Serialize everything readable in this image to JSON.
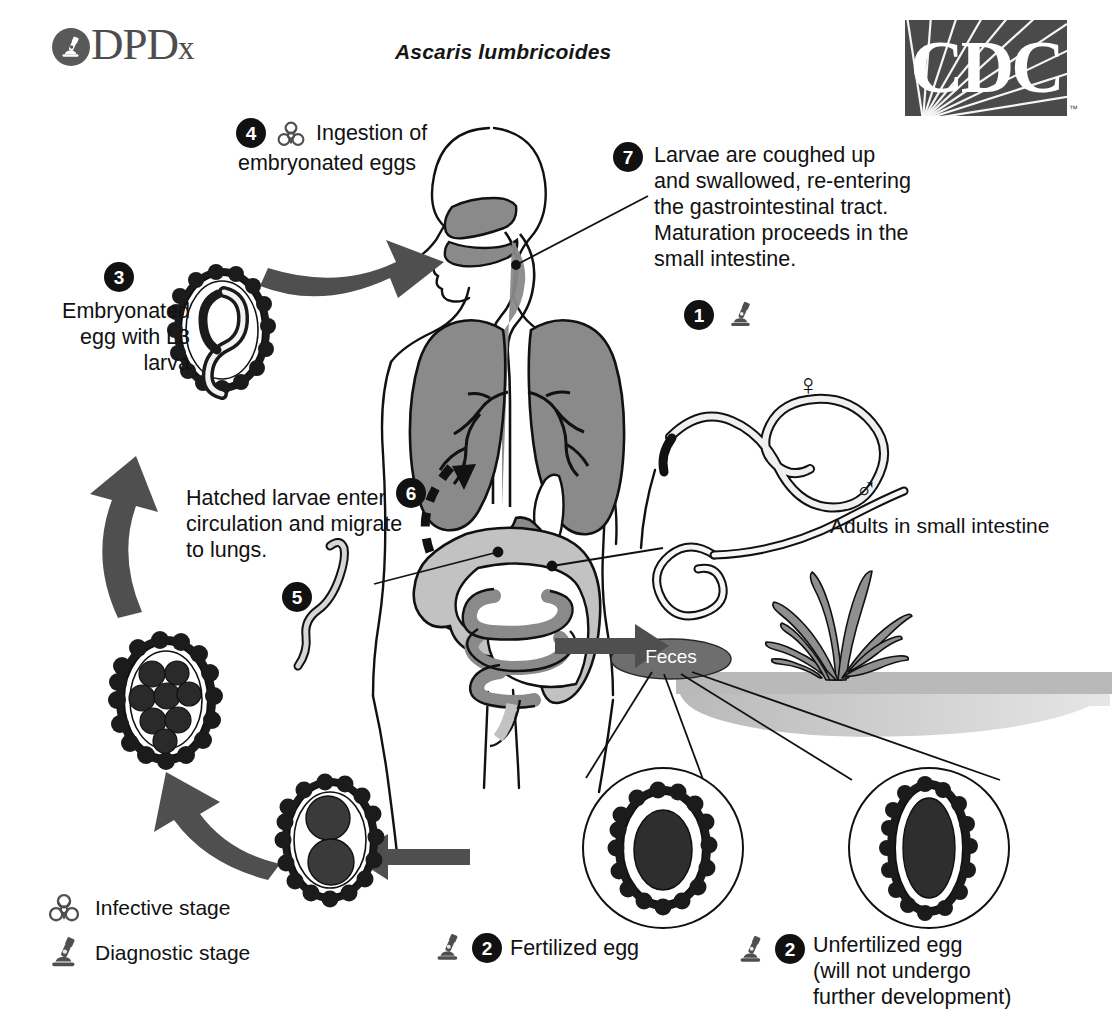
{
  "header": {
    "logo_word_main": "DPD",
    "logo_word_small": "x",
    "logo_mark_icon": "microscope-icon",
    "scientific_name": "Ascaris lumbricoides",
    "cdc_logo_text": "CDC",
    "cdc_trademark": "™"
  },
  "steps": {
    "s1": {
      "number": "1",
      "icon": "microscope-icon",
      "caption": "Adults in small intestine",
      "female_symbol": "♀",
      "male_symbol": "♂"
    },
    "s2_fertilized": {
      "number": "2",
      "icon": "microscope-icon",
      "label": "Fertilized egg"
    },
    "s2_unfertilized": {
      "number": "2",
      "icon": "microscope-icon",
      "label_line1": "Unfertilized egg",
      "label_line2": "(will not undergo",
      "label_line3": "further development)"
    },
    "s3": {
      "number": "3",
      "line1": "Embryonated",
      "line2": "egg with L3",
      "line3": "larva"
    },
    "s4": {
      "number": "4",
      "icon": "biohazard-icon",
      "line1": "Ingestion of",
      "line2": "embryonated eggs"
    },
    "s5": {
      "number": "5"
    },
    "s6": {
      "number": "6",
      "line1": "Hatched larvae enter",
      "line2": "circulation and migrate",
      "line3": "to lungs."
    },
    "s7": {
      "number": "7",
      "line1": "Larvae are coughed up",
      "line2": "and swallowed, re-entering",
      "line3": "the gastrointestinal tract.",
      "line4": "Maturation proceeds in the",
      "line5": "small intestine."
    }
  },
  "environment": {
    "feces_label": "Feces"
  },
  "legend": {
    "items": [
      {
        "icon": "biohazard-icon",
        "label": "Infective stage"
      },
      {
        "icon": "microscope-icon",
        "label": "Diagnostic stage"
      }
    ]
  },
  "colors": {
    "ink": "#111111",
    "badge": "#111111",
    "logo_gray": "#4d4d4d",
    "cdc_box": "#4a4a4a",
    "organ_dark_gray": "#8a8a8a",
    "organ_light_gray": "#c2c2c2",
    "arrow_gray": "#4f4f4f",
    "soil_gray": "#b5b5b5",
    "feces_gray": "#6e6e6e",
    "background": "#ffffff"
  }
}
